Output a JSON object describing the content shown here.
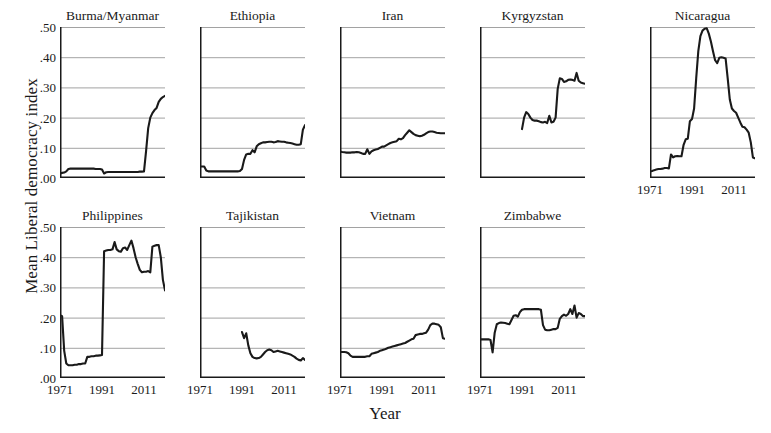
{
  "chart_data": {
    "type": "line",
    "title": "",
    "xlabel": "Year",
    "ylabel": "Mean Liberal democracy index",
    "ylim": [
      0.0,
      0.5
    ],
    "xlim": [
      1971,
      2021
    ],
    "ytick_labels": [
      ".00",
      ".10",
      ".20",
      ".30",
      ".40",
      ".50"
    ],
    "ytick_values": [
      0.0,
      0.1,
      0.2,
      0.3,
      0.4,
      0.5
    ],
    "xtick_labels": [
      "1971",
      "1991",
      "2011"
    ],
    "xtick_values": [
      1971,
      1991,
      2011
    ],
    "grid": "horizontal",
    "legend": "none",
    "line_color": "#1a1a1a",
    "grid_color": "#8a8a8a",
    "axis_color": "#1a1a1a",
    "layout": "small-multiples 5x2",
    "panels": [
      {
        "name": "Burma/Myanmar",
        "row": 0,
        "col": 0,
        "x_start": 1971,
        "x_end": 2021,
        "values": [
          0.015,
          0.017,
          0.018,
          0.022,
          0.03,
          0.031,
          0.031,
          0.031,
          0.031,
          0.031,
          0.031,
          0.031,
          0.031,
          0.031,
          0.031,
          0.031,
          0.031,
          0.03,
          0.03,
          0.03,
          0.028,
          0.015,
          0.019,
          0.02,
          0.02,
          0.02,
          0.02,
          0.02,
          0.02,
          0.02,
          0.02,
          0.02,
          0.02,
          0.02,
          0.02,
          0.02,
          0.02,
          0.02,
          0.021,
          0.021,
          0.022,
          0.09,
          0.165,
          0.2,
          0.215,
          0.225,
          0.232,
          0.252,
          0.262,
          0.268,
          0.272
        ]
      },
      {
        "name": "Ethiopia",
        "row": 0,
        "col": 1,
        "x_start": 1971,
        "x_end": 2021,
        "values": [
          0.038,
          0.038,
          0.038,
          0.025,
          0.022,
          0.022,
          0.022,
          0.022,
          0.022,
          0.022,
          0.022,
          0.022,
          0.022,
          0.022,
          0.022,
          0.022,
          0.022,
          0.022,
          0.022,
          0.023,
          0.03,
          0.06,
          0.078,
          0.08,
          0.08,
          0.092,
          0.085,
          0.105,
          0.112,
          0.115,
          0.118,
          0.118,
          0.119,
          0.12,
          0.12,
          0.118,
          0.119,
          0.122,
          0.121,
          0.12,
          0.12,
          0.118,
          0.117,
          0.116,
          0.114,
          0.112,
          0.11,
          0.11,
          0.112,
          0.16,
          0.175
        ]
      },
      {
        "name": "Iran",
        "row": 0,
        "col": 2,
        "x_start": 1971,
        "x_end": 2021,
        "values": [
          0.088,
          0.086,
          0.085,
          0.084,
          0.084,
          0.084,
          0.085,
          0.085,
          0.086,
          0.085,
          0.083,
          0.08,
          0.08,
          0.095,
          0.08,
          0.088,
          0.092,
          0.094,
          0.096,
          0.1,
          0.104,
          0.104,
          0.108,
          0.112,
          0.116,
          0.118,
          0.12,
          0.122,
          0.13,
          0.128,
          0.132,
          0.142,
          0.15,
          0.158,
          0.152,
          0.146,
          0.142,
          0.14,
          0.138,
          0.14,
          0.143,
          0.148,
          0.152,
          0.154,
          0.154,
          0.152,
          0.15,
          0.149,
          0.148,
          0.148,
          0.148
        ]
      },
      {
        "name": "Kyrgyzstan",
        "row": 0,
        "col": 3,
        "x_start": 1991,
        "x_end": 2021,
        "values": [
          0.162,
          0.2,
          0.218,
          0.212,
          0.2,
          0.192,
          0.19,
          0.19,
          0.188,
          0.185,
          0.184,
          0.186,
          0.182,
          0.206,
          0.184,
          0.186,
          0.2,
          0.295,
          0.33,
          0.328,
          0.318,
          0.32,
          0.325,
          0.326,
          0.325,
          0.322,
          0.348,
          0.322,
          0.316,
          0.314,
          0.312
        ]
      },
      {
        "name": "Nicaragua",
        "row": 0,
        "col": 4,
        "x_start": 1971,
        "x_end": 2021,
        "values": [
          0.022,
          0.023,
          0.026,
          0.028,
          0.03,
          0.03,
          0.031,
          0.033,
          0.033,
          0.032,
          0.078,
          0.068,
          0.072,
          0.073,
          0.072,
          0.072,
          0.11,
          0.128,
          0.13,
          0.188,
          0.195,
          0.23,
          0.33,
          0.42,
          0.47,
          0.488,
          0.494,
          0.496,
          0.478,
          0.452,
          0.42,
          0.39,
          0.38,
          0.398,
          0.4,
          0.398,
          0.396,
          0.33,
          0.26,
          0.23,
          0.222,
          0.216,
          0.2,
          0.184,
          0.17,
          0.168,
          0.16,
          0.15,
          0.118,
          0.068,
          0.065
        ]
      },
      {
        "name": "Philippines",
        "row": 1,
        "col": 0,
        "x_start": 1971,
        "x_end": 2021,
        "values": [
          0.208,
          0.205,
          0.09,
          0.048,
          0.042,
          0.042,
          0.042,
          0.044,
          0.044,
          0.046,
          0.046,
          0.048,
          0.048,
          0.07,
          0.07,
          0.072,
          0.072,
          0.074,
          0.074,
          0.075,
          0.076,
          0.42,
          0.422,
          0.424,
          0.424,
          0.426,
          0.45,
          0.426,
          0.42,
          0.418,
          0.43,
          0.432,
          0.424,
          0.44,
          0.455,
          0.43,
          0.4,
          0.378,
          0.358,
          0.35,
          0.352,
          0.352,
          0.354,
          0.35,
          0.435,
          0.438,
          0.44,
          0.44,
          0.4,
          0.325,
          0.29
        ]
      },
      {
        "name": "Tajikistan",
        "row": 1,
        "col": 1,
        "x_start": 1991,
        "x_end": 2021,
        "values": [
          0.152,
          0.132,
          0.148,
          0.108,
          0.082,
          0.07,
          0.066,
          0.065,
          0.066,
          0.07,
          0.078,
          0.086,
          0.092,
          0.094,
          0.092,
          0.086,
          0.088,
          0.09,
          0.088,
          0.086,
          0.084,
          0.082,
          0.08,
          0.078,
          0.074,
          0.07,
          0.064,
          0.06,
          0.058,
          0.066,
          0.06
        ]
      },
      {
        "name": "Vietnam",
        "row": 1,
        "col": 2,
        "x_start": 1971,
        "x_end": 2021,
        "values": [
          0.086,
          0.086,
          0.086,
          0.085,
          0.082,
          0.074,
          0.07,
          0.07,
          0.07,
          0.07,
          0.07,
          0.07,
          0.07,
          0.072,
          0.072,
          0.08,
          0.082,
          0.084,
          0.086,
          0.09,
          0.092,
          0.094,
          0.097,
          0.1,
          0.102,
          0.104,
          0.106,
          0.108,
          0.11,
          0.112,
          0.114,
          0.116,
          0.12,
          0.124,
          0.128,
          0.13,
          0.142,
          0.144,
          0.146,
          0.146,
          0.148,
          0.15,
          0.16,
          0.175,
          0.18,
          0.18,
          0.178,
          0.176,
          0.168,
          0.132,
          0.13
        ]
      },
      {
        "name": "Zimbabwe",
        "row": 1,
        "col": 3,
        "x_start": 1971,
        "x_end": 2021,
        "values": [
          0.128,
          0.128,
          0.128,
          0.128,
          0.128,
          0.126,
          0.085,
          0.15,
          0.178,
          0.182,
          0.184,
          0.183,
          0.182,
          0.18,
          0.178,
          0.192,
          0.206,
          0.208,
          0.203,
          0.218,
          0.226,
          0.228,
          0.228,
          0.228,
          0.228,
          0.228,
          0.228,
          0.228,
          0.228,
          0.226,
          0.175,
          0.16,
          0.158,
          0.158,
          0.16,
          0.162,
          0.162,
          0.166,
          0.196,
          0.205,
          0.21,
          0.206,
          0.212,
          0.228,
          0.212,
          0.24,
          0.2,
          0.215,
          0.212,
          0.205,
          0.205
        ]
      }
    ]
  }
}
